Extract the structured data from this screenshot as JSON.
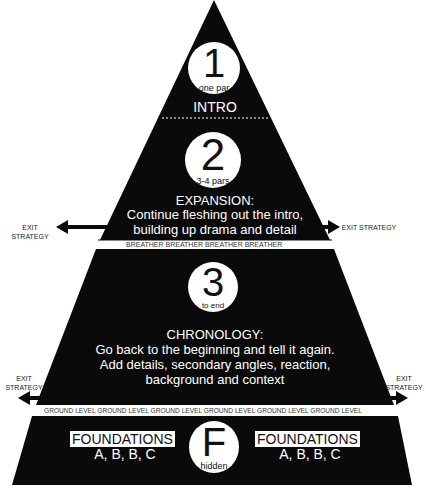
{
  "sections": [
    {
      "number": "1",
      "sub": "one par",
      "title": "INTRO",
      "body": []
    },
    {
      "number": "2",
      "sub": "3-4 pars",
      "title": "EXPANSION:",
      "body": [
        "Continue fleshing out the intro,",
        "building up drama and detail"
      ]
    },
    {
      "number": "3",
      "sub": "to end",
      "title": "CHRONOLOGY:",
      "body": [
        "Go back to the beginning and tell it again.",
        "Add details, secondary angles, reaction,",
        "background and context"
      ]
    },
    {
      "number": "F",
      "sub": "hidden"
    }
  ],
  "bands": {
    "breather": "BREATHER  BREATHER  BREATHER  BREATHER",
    "ground": "GROUND LEVEL  GROUND LEVEL  GROUND LEVEL  GROUND LEVEL  GROUND LEVEL  GROUND LEVEL"
  },
  "exits": {
    "upper_left": "EXIT STRATEGY",
    "upper_right": "EXIT STRATEGY",
    "lower_left_1": "EXIT",
    "lower_left_2": "STRATEGY",
    "lower_right_1": "EXIT",
    "lower_right_2": "STRATEGY"
  },
  "foundations": {
    "left_label": "FOUNDATIONS",
    "left_sub": "A, B, B, C",
    "right_label": "FOUNDATIONS",
    "right_sub": "A, B, B, C"
  },
  "colors": {
    "pyramid": "#0a0a0a",
    "background": "#ffffff",
    "band": "#ffffff"
  }
}
